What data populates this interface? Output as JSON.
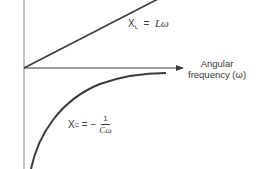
{
  "diagram": {
    "type": "reactance-vs-frequency",
    "axes": {
      "x_label_line1": "Angular",
      "x_label_line2": "frequency (ω)"
    },
    "curves": {
      "inductive": {
        "symbol": "X",
        "subscript": "L",
        "equals": "=",
        "expression": "Lω"
      },
      "capacitive": {
        "symbol": "X",
        "subscript": "C",
        "equals": "=",
        "sign": "−",
        "numerator": "1",
        "denominator": "Cω"
      }
    },
    "colors": {
      "line": "#3a3a3a",
      "background": "#ffffff"
    }
  }
}
